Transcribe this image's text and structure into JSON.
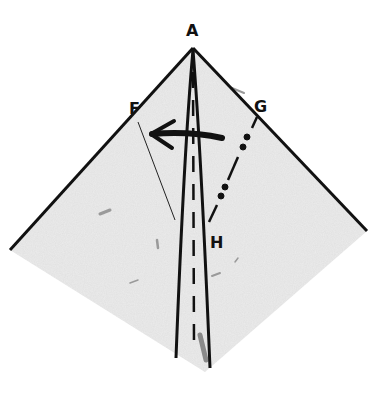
{
  "diagram": {
    "type": "origami-fold-step",
    "colors": {
      "paper": "#e9e9e9",
      "ink": "#111111",
      "background": "#ffffff"
    },
    "points": {
      "A": {
        "label": "A",
        "x": 193,
        "y": 48
      },
      "F": {
        "label": "F",
        "x": 127,
        "y": 98
      },
      "G": {
        "label": "G",
        "x": 256,
        "y": 96
      },
      "H": {
        "label": "H",
        "x": 210,
        "y": 232
      }
    },
    "labels": [
      "A",
      "F",
      "G",
      "H"
    ],
    "lines": [
      {
        "name": "left-edge",
        "style": "solid",
        "from": [
          193,
          48
        ],
        "to": [
          10,
          250
        ]
      },
      {
        "name": "right-edge",
        "style": "solid",
        "from": [
          193,
          48
        ],
        "to": [
          367,
          231
        ]
      },
      {
        "name": "center-left-crease",
        "style": "solid",
        "from": [
          193,
          50
        ],
        "to": [
          176,
          358
        ]
      },
      {
        "name": "center-right-crease",
        "style": "solid",
        "from": [
          193,
          50
        ],
        "to": [
          210,
          368
        ]
      },
      {
        "name": "center-valley-fold",
        "style": "dashed",
        "from": [
          193,
          70
        ],
        "to": [
          194,
          345
        ]
      },
      {
        "name": "fold-line-G-H",
        "style": "dash-dot",
        "from": [
          257,
          117
        ],
        "to": [
          209,
          222
        ]
      },
      {
        "name": "reference-line-F",
        "style": "thin",
        "from": [
          138,
          122
        ],
        "to": [
          175,
          220
        ]
      }
    ],
    "arrow": {
      "name": "fold-direction-arrow",
      "from": [
        222,
        137
      ],
      "to": [
        150,
        134
      ],
      "direction": "left"
    }
  }
}
